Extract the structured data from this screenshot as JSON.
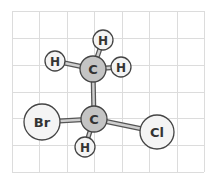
{
  "diagram": {
    "title": "",
    "type": "ball-and-stick molecular model",
    "colors": {
      "background": "#ffffff",
      "grid": "#dcdcdc",
      "carbon_fill": "#c4c4c4",
      "other_fill": "#f4f4f4",
      "atom_outline": "#444444",
      "bond_fill": "#cfcfcf",
      "bond_outline": "#555555",
      "label": "#333333"
    },
    "grid": {
      "x0": 12,
      "y0": 11,
      "x1": 204,
      "y1": 172,
      "cols": 7,
      "rows": 6
    },
    "atoms": [
      {
        "id": "c1",
        "element": "C",
        "label": "C",
        "x": 93,
        "y": 69,
        "r": 13,
        "fill": "carbon"
      },
      {
        "id": "h1",
        "element": "H",
        "label": "H",
        "x": 103,
        "y": 40,
        "r": 10,
        "fill": "other"
      },
      {
        "id": "h2",
        "element": "H",
        "label": "H",
        "x": 55,
        "y": 61,
        "r": 10,
        "fill": "other"
      },
      {
        "id": "h3",
        "element": "H",
        "label": "H",
        "x": 121,
        "y": 67,
        "r": 10,
        "fill": "other"
      },
      {
        "id": "c2",
        "element": "C",
        "label": "C",
        "x": 94,
        "y": 119,
        "r": 13,
        "fill": "carbon"
      },
      {
        "id": "br",
        "element": "Br",
        "label": "Br",
        "x": 42,
        "y": 122,
        "r": 18,
        "fill": "other"
      },
      {
        "id": "cl",
        "element": "Cl",
        "label": "Cl",
        "x": 157,
        "y": 132,
        "r": 17,
        "fill": "other"
      },
      {
        "id": "h4",
        "element": "H",
        "label": "H",
        "x": 85,
        "y": 147,
        "r": 10,
        "fill": "other"
      }
    ],
    "bonds": [
      {
        "from": "c1",
        "to": "h1"
      },
      {
        "from": "c1",
        "to": "h2"
      },
      {
        "from": "c1",
        "to": "h3"
      },
      {
        "from": "c1",
        "to": "c2"
      },
      {
        "from": "c2",
        "to": "br"
      },
      {
        "from": "c2",
        "to": "cl"
      },
      {
        "from": "c2",
        "to": "h4"
      }
    ]
  }
}
